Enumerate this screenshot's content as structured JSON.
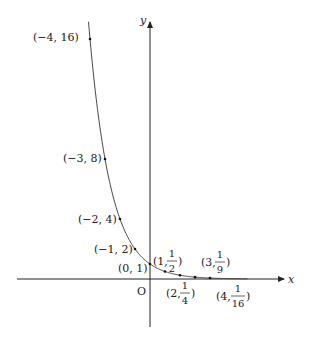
{
  "figure": {
    "type": "function-graph",
    "function": "y = (1/2)^x",
    "axes": {
      "x_label": "x",
      "y_label": "y",
      "origin_label": "O"
    },
    "colors": {
      "curve": "#333333",
      "axis": "#222222",
      "point": "#111111"
    }
  },
  "points": [
    {
      "x": -4,
      "y": 16,
      "label": "(−4, 16)"
    },
    {
      "x": -3,
      "y": 8,
      "label": "(−3, 8)"
    },
    {
      "x": -2,
      "y": 4,
      "label": "(−2, 4)"
    },
    {
      "x": -1,
      "y": 2,
      "label": "(−1, 2)"
    },
    {
      "x": 0,
      "y": 1,
      "label": "(0, 1)"
    },
    {
      "x": 1,
      "y": 0.5,
      "label_pre": "(1, ",
      "num": "1",
      "den": "2",
      "label_post": ")"
    },
    {
      "x": 2,
      "y": 0.25,
      "label_pre": "(2, ",
      "num": "1",
      "den": "4",
      "label_post": ")"
    },
    {
      "x": 3,
      "y": 0.125,
      "label_pre": "(3, ",
      "num": "1",
      "den": "9",
      "label_post": ")"
    },
    {
      "x": 4,
      "y": 0.0625,
      "label_pre": "(4, ",
      "num": "1",
      "den": "16",
      "label_post": ")"
    }
  ]
}
